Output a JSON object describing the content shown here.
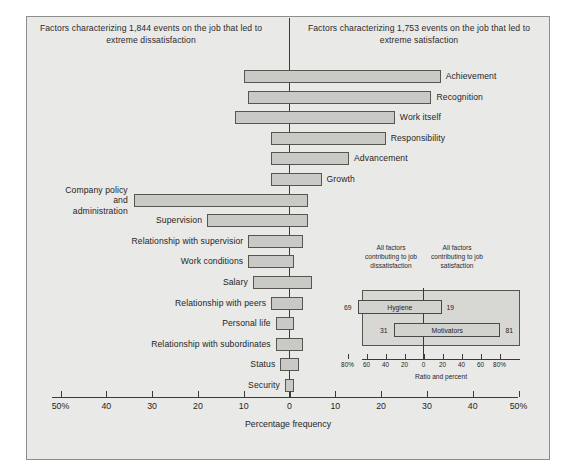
{
  "figure": {
    "background_color": "#e9e9e7",
    "bar_fill_color": "#c9c9c6",
    "bar_stroke_color": "#56564f",
    "axis_color": "#3a3a38"
  },
  "header": {
    "left_caption": "Factors characterizing 1,844 events on the job that led to extreme dissatisfaction",
    "right_caption": "Factors characterizing 1,753 events on the job that led to extreme satisfaction"
  },
  "chart_data": {
    "type": "bar",
    "title": "",
    "xlabel": "Percentage frequency",
    "ylabel": "",
    "xlim": [
      -50,
      50
    ],
    "grid": false,
    "legend": "none",
    "orientation": "horizontal-diverging",
    "axis_ticks": [
      {
        "value": -50,
        "label": "50%"
      },
      {
        "value": -40,
        "label": "40"
      },
      {
        "value": -30,
        "label": "30"
      },
      {
        "value": -20,
        "label": "20"
      },
      {
        "value": -10,
        "label": "10"
      },
      {
        "value": 0,
        "label": "0"
      },
      {
        "value": 10,
        "label": "10"
      },
      {
        "value": 20,
        "label": "20"
      },
      {
        "value": 30,
        "label": "30"
      },
      {
        "value": 40,
        "label": "40"
      },
      {
        "value": 50,
        "label": "50%"
      }
    ],
    "categories": [
      "Achievement",
      "Recognition",
      "Work itself",
      "Responsibility",
      "Advancement",
      "Growth",
      "Company policy and administration",
      "Supervision",
      "Relationship with supervisior",
      "Work conditions",
      "Salary",
      "Relationship with peers",
      "Personal life",
      "Relationship with subordinates",
      "Status",
      "Security"
    ],
    "series": [
      {
        "name": "Dissatisfaction (left of zero, negative)",
        "values": [
          -10,
          -9,
          -12,
          -4,
          -4,
          -4,
          -34,
          -18,
          -9,
          -9,
          -8,
          -4,
          -3,
          -3,
          -2,
          -1
        ]
      },
      {
        "name": "Satisfaction (right of zero, positive)",
        "values": [
          33,
          31,
          23,
          21,
          13,
          7,
          4,
          4,
          3,
          1,
          5,
          3,
          1,
          3,
          2,
          1
        ]
      }
    ],
    "rows": [
      {
        "label": "Achievement",
        "label_side": "right",
        "neg": -10,
        "pos": 33
      },
      {
        "label": "Recognition",
        "label_side": "right",
        "neg": -9,
        "pos": 31
      },
      {
        "label": "Work itself",
        "label_side": "right",
        "neg": -12,
        "pos": 23
      },
      {
        "label": "Responsibility",
        "label_side": "right",
        "neg": -4,
        "pos": 21
      },
      {
        "label": "Advancement",
        "label_side": "right",
        "neg": -4,
        "pos": 13
      },
      {
        "label": "Growth",
        "label_side": "right",
        "neg": -4,
        "pos": 7
      },
      {
        "label": "Company policy and administration",
        "label_side": "left-multi",
        "neg": -34,
        "pos": 4
      },
      {
        "label": "Supervision",
        "label_side": "left",
        "neg": -18,
        "pos": 4
      },
      {
        "label": "Relationship with supervisior",
        "label_side": "left",
        "neg": -9,
        "pos": 3
      },
      {
        "label": "Work conditions",
        "label_side": "left",
        "neg": -9,
        "pos": 1
      },
      {
        "label": "Salary",
        "label_side": "left",
        "neg": -8,
        "pos": 5
      },
      {
        "label": "Relationship with peers",
        "label_side": "left",
        "neg": -4,
        "pos": 3
      },
      {
        "label": "Personal life",
        "label_side": "left",
        "neg": -3,
        "pos": 1
      },
      {
        "label": "Relationship with subordinates",
        "label_side": "left",
        "neg": -3,
        "pos": 3
      },
      {
        "label": "Status",
        "label_side": "left",
        "neg": -2,
        "pos": 2
      },
      {
        "label": "Security",
        "label_side": "left",
        "neg": -1,
        "pos": 1
      }
    ],
    "inset": {
      "type": "bar",
      "left_caption": "All factors contributing to job dissatisfaction",
      "right_caption": "All factors contributing to job satisfaction",
      "xlabel": "Ratio and percent",
      "xlim": [
        -80,
        80
      ],
      "axis_ticks": [
        {
          "value": -80,
          "label": "80%"
        },
        {
          "value": -60,
          "label": "60"
        },
        {
          "value": -40,
          "label": "40"
        },
        {
          "value": -20,
          "label": "20"
        },
        {
          "value": 0,
          "label": "0"
        },
        {
          "value": 20,
          "label": "20"
        },
        {
          "value": 40,
          "label": "40"
        },
        {
          "value": 60,
          "label": "60"
        },
        {
          "value": 80,
          "label": "80%"
        }
      ],
      "rows": [
        {
          "label": "Hygiene",
          "neg_value": 69,
          "pos_value": 19
        },
        {
          "label": "Motivators",
          "neg_value": 31,
          "pos_value": 81
        }
      ]
    }
  }
}
